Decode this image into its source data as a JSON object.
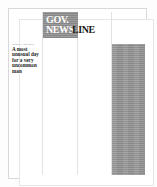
{
  "page": {
    "type": "newsletter-front-page",
    "background_color": "#ffffff",
    "border_color": "#d8d8d8"
  },
  "masthead": {
    "logo_part_1": "GOV.",
    "logo_part_2": "NEWS",
    "logo_part_3": "LINE",
    "block_color": "#8c8c8c",
    "logo_light_color": "#ffffff",
    "logo_dark_color": "#1a1a1a"
  },
  "lead_story": {
    "kicker": "SPECIAL REPORT",
    "headline": "A most unusual day for a very uncommon man"
  },
  "photo": {
    "caption": "",
    "fill_color": "#949494"
  },
  "columns": {
    "count": 4,
    "rule_color": "#e2e2e2"
  }
}
